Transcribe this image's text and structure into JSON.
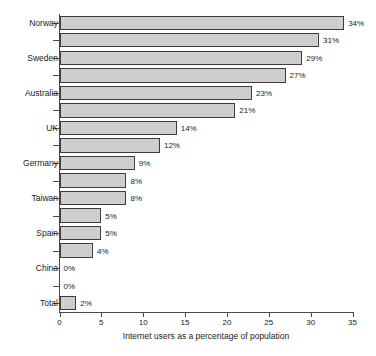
{
  "chart_data": {
    "type": "bar",
    "orientation": "horizontal",
    "title": "",
    "xlabel": "Internet users as a percentage of population",
    "ylabel": "",
    "xlim": [
      0,
      35
    ],
    "xticks": [
      0,
      5,
      10,
      15,
      20,
      25,
      30,
      35
    ],
    "xtick_labels": [
      "0",
      "5",
      "10",
      "15",
      "20",
      "25",
      "30",
      "35"
    ],
    "grid": false,
    "legend": false,
    "value_suffix": "%",
    "bar_fill_color": "#d0d0d0",
    "bar_edge_color": "#3d3d3d",
    "axis_color": "#4a4a4a",
    "categories": [
      "Norway",
      "",
      "Sweden",
      "",
      "Australia",
      "",
      "UK",
      "",
      "Germany",
      "",
      "Taiwan",
      "",
      "Spain",
      "",
      "China",
      "",
      "Total"
    ],
    "values": [
      34,
      31,
      29,
      27,
      23,
      21,
      14,
      12,
      9,
      8,
      8,
      5,
      5,
      4,
      0,
      0,
      2
    ],
    "data_labels": [
      "34%",
      "31%",
      "29%",
      "27%",
      "23%",
      "21%",
      "14%",
      "12%",
      "9%",
      "8%",
      "8%",
      "5%",
      "5%",
      "4%",
      "0%",
      "0%",
      "2%"
    ],
    "visible_tick_labels": [
      "Norway",
      "Sweden",
      "Australia",
      "UK",
      "Germany",
      "Taiwan",
      "Spain",
      "China",
      "Total"
    ]
  }
}
